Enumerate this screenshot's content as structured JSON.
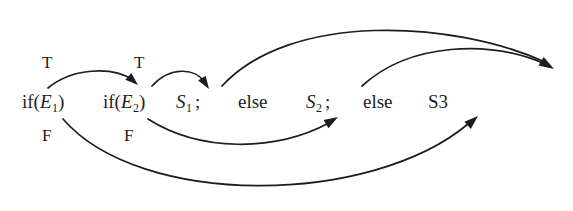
{
  "figure": {
    "kind": "control-flow-diagram",
    "background_color": "#ffffff",
    "ink_color": "#1d1d1d",
    "width": 573,
    "height": 211
  },
  "statement": {
    "tokens": [
      {
        "id": "if_e1",
        "text": "if(",
        "var": "E",
        "sub": "1",
        "close": ")",
        "x": 22,
        "y": 105
      },
      {
        "id": "if_e2",
        "text": "if(",
        "var": "E",
        "sub": "2",
        "close": ")",
        "x": 103,
        "y": 105
      },
      {
        "id": "s1",
        "var": "S",
        "sub": "1",
        "semicolon": ";",
        "x": 176,
        "y": 105
      },
      {
        "id": "else_1",
        "text": "else",
        "x": 238,
        "y": 105
      },
      {
        "id": "s2",
        "var": "S",
        "sub": "2",
        "semicolon": ";",
        "x": 306,
        "y": 105
      },
      {
        "id": "else_2",
        "text": "else",
        "x": 363,
        "y": 105
      },
      {
        "id": "s3",
        "text": "S3",
        "x": 428,
        "y": 105
      }
    ]
  },
  "branch_labels": [
    {
      "id": "true_1",
      "text": "T",
      "x": 42,
      "y": 62
    },
    {
      "id": "true_2",
      "text": "T",
      "x": 134,
      "y": 62
    },
    {
      "id": "false_1",
      "text": "F",
      "x": 42,
      "y": 135
    },
    {
      "id": "false_2",
      "text": "F",
      "x": 124,
      "y": 135
    }
  ],
  "edges": [
    {
      "id": "e1-true-to-e2",
      "from": "if(E1)",
      "to": "if(E2)",
      "condition": "T",
      "path": "M 48 88 C 72 68, 112 66, 133 80",
      "arrowhead": {
        "x": 137,
        "y": 84,
        "angle": 42
      }
    },
    {
      "id": "e2-true-to-s1",
      "from": "if(E2)",
      "to": "S1",
      "condition": "T",
      "path": "M 152 86 C 170 66, 196 68, 204 82",
      "arrowhead": {
        "x": 208,
        "y": 88,
        "angle": 57
      }
    },
    {
      "id": "s1-to-end",
      "from": "S1",
      "to": "end",
      "condition": "",
      "path": "M 222 86 C 290 12, 452 20, 545 62",
      "arrowhead": {
        "x": 553,
        "y": 68,
        "angle": 31
      }
    },
    {
      "id": "s2-to-end",
      "from": "S2",
      "to": "end",
      "condition": "",
      "path": "M 362 86 C 410 42, 490 40, 545 64",
      "arrowhead": {
        "x": 553,
        "y": 68,
        "angle": 31
      }
    },
    {
      "id": "e2-false-to-s2",
      "from": "if(E2)",
      "to": "S2",
      "condition": "F",
      "path": "M 148 119 C 200 152, 274 152, 329 123",
      "arrowhead": {
        "x": 337,
        "y": 118,
        "angle": -31
      }
    },
    {
      "id": "e1-false-to-s3",
      "from": "if(E1)",
      "to": "S3",
      "condition": "F",
      "path": "M 63 119 C 140 208, 370 206, 468 124",
      "arrowhead": {
        "x": 477,
        "y": 117,
        "angle": -42
      }
    }
  ]
}
